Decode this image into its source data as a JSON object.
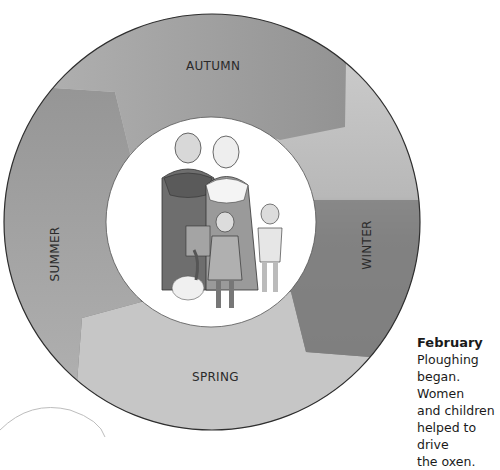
{
  "wheel": {
    "title": "Seasons of the farming year",
    "segments": [
      {
        "season": "AUTUMN",
        "position": "top",
        "tone": "#9a9a9a"
      },
      {
        "season": "WINTER",
        "position": "right",
        "tone_top": "#c9c9c9",
        "tone_bottom": "#7e7e7e"
      },
      {
        "season": "SPRING",
        "position": "bottom",
        "tone": "#c4c4c4"
      },
      {
        "season": "SUMMER",
        "position": "left",
        "tone": "#a9a9a9"
      }
    ],
    "center_image": "medieval-peasant-family-illustration"
  },
  "labels": {
    "autumn": "AUTUMN",
    "winter": "WINTER",
    "spring": "SPRING",
    "summer": "SUMMER"
  },
  "caption": {
    "title": "February",
    "body_lines": [
      "Ploughing",
      "began. Women",
      "and children",
      "helped to drive",
      "the oxen."
    ]
  }
}
